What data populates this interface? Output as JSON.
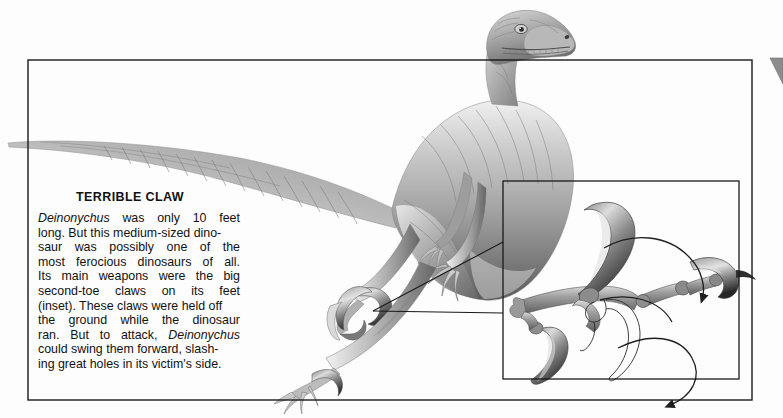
{
  "page": {
    "background_color": "#fdfdfd",
    "ink_color": "#1a1a1a"
  },
  "caption": {
    "title": "TERRIBLE CLAW",
    "text": "Deinonychus was only 10 feet long. But this medium-sized dinosaur was possibly one of the most ferocious dinosaurs of all. Its main weapons were the big second-toe claws on its feet (inset). These claws were held off the ground while the dinosaur ran. But to attack, Deinonychus could swing them forward, slashing great holes in its victim's side.",
    "lines": [
      {
        "words": [
          "Deinonychus",
          "was",
          "only",
          "10",
          "feet"
        ],
        "italic_words": [
          "Deinonychus"
        ],
        "justified": true
      },
      {
        "words": [
          "long.",
          "But this",
          "medium-sized",
          "dino-"
        ],
        "italic_words": [],
        "justified": false
      },
      {
        "words": [
          "saur",
          "was",
          "possibly",
          "one",
          "of",
          "the"
        ],
        "italic_words": [],
        "justified": true
      },
      {
        "words": [
          "most",
          "ferocious",
          "dinosaurs",
          "of",
          "all."
        ],
        "italic_words": [],
        "justified": true
      },
      {
        "words": [
          "Its",
          "main",
          "weapons",
          "were",
          "the",
          "big"
        ],
        "italic_words": [],
        "justified": true
      },
      {
        "words": [
          "second-toe",
          "claws",
          "on",
          "its",
          "feet"
        ],
        "italic_words": [],
        "justified": true
      },
      {
        "words": [
          "(inset).",
          "These claws",
          "were",
          "held",
          "off"
        ],
        "italic_words": [],
        "justified": false
      },
      {
        "words": [
          "the",
          "ground",
          "while",
          "the",
          "dinosaur"
        ],
        "italic_words": [],
        "justified": true
      },
      {
        "words": [
          "ran.",
          "But",
          "to",
          "attack,",
          "Deinonychus"
        ],
        "italic_words": [
          "Deinonychus"
        ],
        "justified": true
      },
      {
        "words": [
          "could",
          "swing",
          "them",
          "forward,",
          "slash-"
        ],
        "italic_words": [],
        "justified": false
      },
      {
        "words": [
          "ing great",
          "holes",
          "in its",
          "victim's",
          "side."
        ],
        "italic_words": [],
        "justified": false
      }
    ]
  },
  "illustration": {
    "subject": "deinonychus-dinosaur",
    "description": "Grayscale airbrush illustration of a Deinonychus running, head raised above the frame, long striped tail extending past the left frame edge, one foot planted and one foot raised showing the sickle claw.",
    "palette": {
      "skin_light": "#e6e6e6",
      "skin_mid": "#a8a8a8",
      "skin_dark": "#6d6d6d",
      "skin_shadow": "#4a4a4a",
      "claw_dark": "#3a3a3a"
    }
  },
  "inset": {
    "label": "foot-bones-inset",
    "description": "Inset diagram of the Deinonychus foot skeleton showing the enlarged second-toe sickle claw, with curved motion arrows indicating how the claw swings forward.",
    "arrows": [
      "upper-swing-arrow",
      "lower-swing-arrow"
    ],
    "ghost_outline": "retracted-claw-outline"
  },
  "frames": {
    "outer_frame": {
      "x": 28,
      "y": 60,
      "width": 724,
      "height": 340
    },
    "inset_frame": {
      "x": 503,
      "y": 181,
      "width": 236,
      "height": 198
    },
    "leader_lines": 2
  },
  "edge_marker": {
    "name": "page-corner-marker",
    "color": "#8c8c8c"
  }
}
